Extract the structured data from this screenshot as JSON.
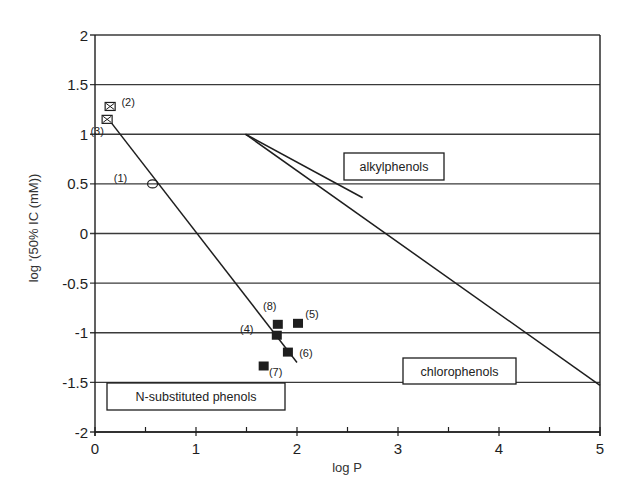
{
  "chart_data": {
    "type": "scatter",
    "title": "",
    "xlabel": "log P",
    "ylabel": "log '(50% IC (mM))",
    "xlim": [
      0,
      5
    ],
    "ylim": [
      -2,
      2
    ],
    "x_ticks": [
      0,
      1,
      2,
      3,
      4,
      5
    ],
    "x_minor_ticks": [
      0.5,
      1.5,
      2.5,
      3.5,
      4.5
    ],
    "y_ticks": [
      2,
      1.5,
      1,
      0.5,
      0,
      -0.5,
      -1,
      -1.5,
      -2
    ],
    "x_tick_labels": [
      "0",
      "1",
      "2",
      "3",
      "4",
      "5"
    ],
    "y_tick_labels": [
      "2",
      "1.5",
      "1",
      "0.5",
      "0",
      "-0.5",
      "-1",
      "-1.5",
      "-2"
    ],
    "grid": "horizontal",
    "points": [
      {
        "label": "(1)",
        "x": 0.57,
        "y": 0.5,
        "marker": "open-circle",
        "label_dx": -32,
        "label_dy": -2
      },
      {
        "label": "(2)",
        "x": 0.15,
        "y": 1.28,
        "marker": "crossed-square",
        "label_dx": 18,
        "label_dy": 0
      },
      {
        "label": "(3)",
        "x": 0.12,
        "y": 1.15,
        "marker": "crossed-square",
        "label_dx": -10,
        "label_dy": 16
      },
      {
        "label": "(4)",
        "x": 1.8,
        "y": -1.03,
        "marker": "filled-square",
        "label_dx": -30,
        "label_dy": -3
      },
      {
        "label": "(5)",
        "x": 2.01,
        "y": -0.91,
        "marker": "filled-square",
        "label_dx": 14,
        "label_dy": -6
      },
      {
        "label": "(6)",
        "x": 1.91,
        "y": -1.2,
        "marker": "filled-square",
        "label_dx": 18,
        "label_dy": 4
      },
      {
        "label": "(7)",
        "x": 1.67,
        "y": -1.34,
        "marker": "filled-square",
        "label_dx": 12,
        "label_dy": 10
      },
      {
        "label": "(8)",
        "x": 1.81,
        "y": -0.92,
        "marker": "filled-square",
        "label_dx": -8,
        "label_dy": -15
      }
    ],
    "series": [
      {
        "name": "N-substituted phenols",
        "type": "line",
        "x": [
          0.12,
          2.0
        ],
        "y": [
          1.17,
          -1.3
        ]
      },
      {
        "name": "alkylphenols",
        "type": "line",
        "x": [
          1.49,
          2.65
        ],
        "y": [
          1.0,
          0.36
        ]
      },
      {
        "name": "chlorophenols",
        "type": "line",
        "x": [
          1.49,
          5.0
        ],
        "y": [
          1.0,
          -1.53
        ]
      }
    ],
    "annotations": [
      {
        "text": "N-substituted phenols",
        "x0": 107,
        "y0": 383,
        "x1": 285,
        "y1": 410
      },
      {
        "text": "alkylphenols",
        "x0": 344,
        "y0": 153,
        "x1": 444,
        "y1": 180
      },
      {
        "text": "chlorophenols",
        "x0": 403,
        "y0": 358,
        "x1": 516,
        "y1": 384
      }
    ],
    "legend": "none (boxed in-plot annotations)"
  },
  "colors": {
    "ink": "#1e1e1e",
    "grid": "#3a3a3a",
    "background": "#ffffff"
  }
}
